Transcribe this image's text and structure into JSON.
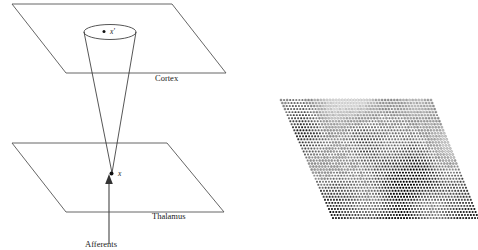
{
  "figure": {
    "background_color": "#ffffff",
    "line_color": "#555555",
    "ink_color": "#111111"
  },
  "left_panel": {
    "name": "cortex-thalamus-schematic",
    "labels": {
      "cortex": "Cortex",
      "thalamus": "Thalamus",
      "afferents": "Afferents",
      "cortex_point": "x'",
      "thalamus_point": "x"
    },
    "planes": [
      {
        "name": "cortex-plane",
        "label": "Cortex",
        "points": "12,4 172,4 226,73 66,73"
      },
      {
        "name": "thalamus-plane",
        "label": "Thalamus",
        "points": "12,143 167,143 224,212 66,212"
      }
    ],
    "cone": {
      "name": "projection-cone",
      "apex_x": 112,
      "apex_y": 173,
      "top_center_x": 110,
      "top_center_y": 32,
      "top_rx": 26,
      "top_ry": 7.5
    },
    "afferent_arrow": {
      "from_x": 109,
      "from_y": 240,
      "to_x": 109,
      "to_y": 176
    }
  },
  "right_panel": {
    "name": "cortical-dot-map",
    "description": "Sheared grid of dots with varying darkness forming a cortical feature map",
    "quad": {
      "top_left_x": 281,
      "top_left_y": 100,
      "top_right_x": 431,
      "top_right_y": 100,
      "bottom_right_x": 478,
      "bottom_right_y": 218,
      "bottom_left_x": 333,
      "bottom_left_y": 218
    },
    "grid": {
      "columns": 50,
      "rows": 40
    },
    "dot_colors": {
      "darkest": "#000000",
      "lightest": "#ffffff",
      "outline": "#555555"
    }
  }
}
